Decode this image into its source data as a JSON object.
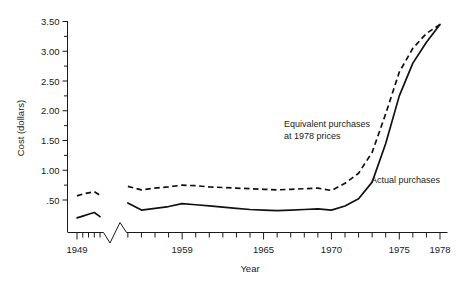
{
  "chart_data": {
    "type": "line",
    "title": "",
    "xlabel": "Year",
    "ylabel": "Cost (dollars)",
    "xlim": [
      1949,
      1978
    ],
    "ylim": [
      0.0,
      3.6
    ],
    "grid": false,
    "axis_break": {
      "present": true,
      "between": [
        1953,
        1955
      ],
      "axis": "x"
    },
    "y_major_ticks": [
      "3.50",
      "3.00",
      "2.50",
      "2.00",
      "1.50",
      "1.00",
      ".50"
    ],
    "y_major_values": [
      3.5,
      3.0,
      2.5,
      2.0,
      1.5,
      1.0,
      0.5
    ],
    "y_minor_step": 0.25,
    "x_tick_labels": [
      "1949",
      "1959",
      "1965",
      "1970",
      "1975",
      "1978"
    ],
    "x_tick_values": [
      1949,
      1959,
      1965,
      1970,
      1975,
      1978
    ],
    "x_minor_step": 1,
    "legend_position": "inline-annotation",
    "series": [
      {
        "name": "Equivalent purchases at 1978 prices",
        "style": "dashed",
        "x": [
          1949,
          1950,
          1951,
          1952,
          1953,
          1955,
          1956,
          1957,
          1958,
          1959,
          1960,
          1961,
          1962,
          1963,
          1964,
          1965,
          1966,
          1967,
          1968,
          1969,
          1970,
          1971,
          1972,
          1973,
          1974,
          1975,
          1976,
          1977,
          1978
        ],
        "values": [
          0.57,
          0.6,
          0.62,
          0.64,
          0.58,
          0.73,
          0.67,
          0.7,
          0.72,
          0.75,
          0.74,
          0.72,
          0.71,
          0.7,
          0.69,
          0.68,
          0.67,
          0.68,
          0.69,
          0.7,
          0.66,
          0.78,
          0.95,
          1.3,
          1.95,
          2.65,
          3.05,
          3.3,
          3.45
        ]
      },
      {
        "name": "Actual purchases",
        "style": "solid",
        "x": [
          1949,
          1950,
          1951,
          1952,
          1953,
          1955,
          1956,
          1957,
          1958,
          1959,
          1960,
          1961,
          1962,
          1963,
          1964,
          1965,
          1966,
          1967,
          1968,
          1969,
          1970,
          1971,
          1972,
          1973,
          1974,
          1975,
          1976,
          1977,
          1978
        ],
        "values": [
          0.2,
          0.23,
          0.26,
          0.29,
          0.22,
          0.45,
          0.33,
          0.36,
          0.39,
          0.44,
          0.42,
          0.4,
          0.38,
          0.36,
          0.34,
          0.33,
          0.32,
          0.33,
          0.34,
          0.35,
          0.33,
          0.4,
          0.52,
          0.8,
          1.45,
          2.25,
          2.8,
          3.15,
          3.45
        ]
      }
    ],
    "annotations": [
      {
        "name": "equivalent-purchases-label",
        "line1": "Equivalent purchases",
        "line2": "at 1978 prices"
      },
      {
        "name": "actual-purchases-label",
        "line1": "Actual purchases",
        "line2": ""
      }
    ]
  },
  "colors": {
    "line": "#111111",
    "axis": "#1a1a1a",
    "background": "#ffffff"
  }
}
